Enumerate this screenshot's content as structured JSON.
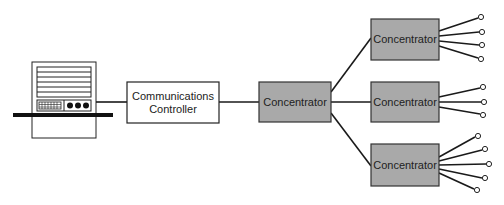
{
  "diagram": {
    "type": "network-topology",
    "colors": {
      "line": "#1a1a1a",
      "concentrator_fill": "#a9a9a9",
      "controller_fill": "#ffffff",
      "endpoint_fill": "#ffffff"
    },
    "nodes": {
      "terminal": {
        "label": ""
      },
      "controller": {
        "line1": "Communications",
        "line2": "Controller"
      },
      "concentrator_center": {
        "label": "Concentrator"
      },
      "concentrator_top": {
        "label": "Concentrator",
        "endpoints": 4
      },
      "concentrator_middle": {
        "label": "Concentrator",
        "endpoints": 3
      },
      "concentrator_bottom": {
        "label": "Concentrator",
        "endpoints": 5
      }
    }
  }
}
